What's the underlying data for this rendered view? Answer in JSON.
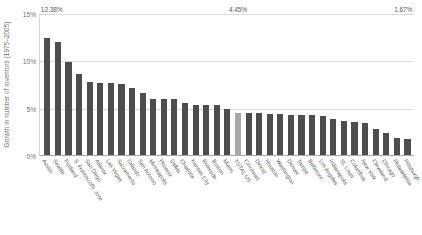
{
  "chart_data": {
    "type": "bar",
    "title": "",
    "xlabel": "",
    "ylabel": "Growth in number of inventors (1975–2005)",
    "ylim": [
      0,
      15
    ],
    "ytick_labels": [
      "0%",
      "5%",
      "10%",
      "15%"
    ],
    "ytick_values": [
      0,
      5,
      10,
      15
    ],
    "grid": "horizontal",
    "legend": "none",
    "bar_color": "#4d4d4f",
    "highlight_bar_color": "#a6a8ab",
    "highlight_category": "TOTAL US",
    "annotations": [
      {
        "category": "Austin",
        "text": "12.38%"
      },
      {
        "category": "TOTAL US",
        "text": "4.45%"
      },
      {
        "category": "Pittsburgh",
        "text": "1.67%"
      }
    ],
    "categories": [
      "Austin",
      "Seattle",
      "Portland",
      "S. Francisco/S. Jose",
      "San Diego",
      "Atlanta",
      "Las Vegas",
      "Sacramento",
      "Orlando",
      "San Antonio",
      "Minneapolis",
      "Phoenix",
      "Dallas",
      "Charlotte",
      "Kansas City",
      "Riverside",
      "Boston",
      "Miami",
      "TOTAL US",
      "Cincinnati",
      "Detroit",
      "Houston",
      "Washington",
      "Denver",
      "Tampa",
      "Baltimore",
      "Los Angeles",
      "Indianapolis",
      "St. Louis",
      "Columbus",
      "New York",
      "Cleveland",
      "Chicago",
      "Philadelphia",
      "Pittsburgh"
    ],
    "values": [
      12.38,
      11.95,
      9.85,
      8.55,
      7.7,
      7.65,
      7.6,
      7.55,
      7.1,
      6.5,
      5.9,
      5.9,
      5.9,
      5.5,
      5.3,
      5.25,
      5.25,
      4.9,
      4.45,
      4.4,
      4.4,
      4.35,
      4.3,
      4.25,
      4.2,
      4.2,
      4.1,
      3.8,
      3.6,
      3.45,
      3.4,
      2.8,
      2.3,
      1.8,
      1.67
    ]
  }
}
